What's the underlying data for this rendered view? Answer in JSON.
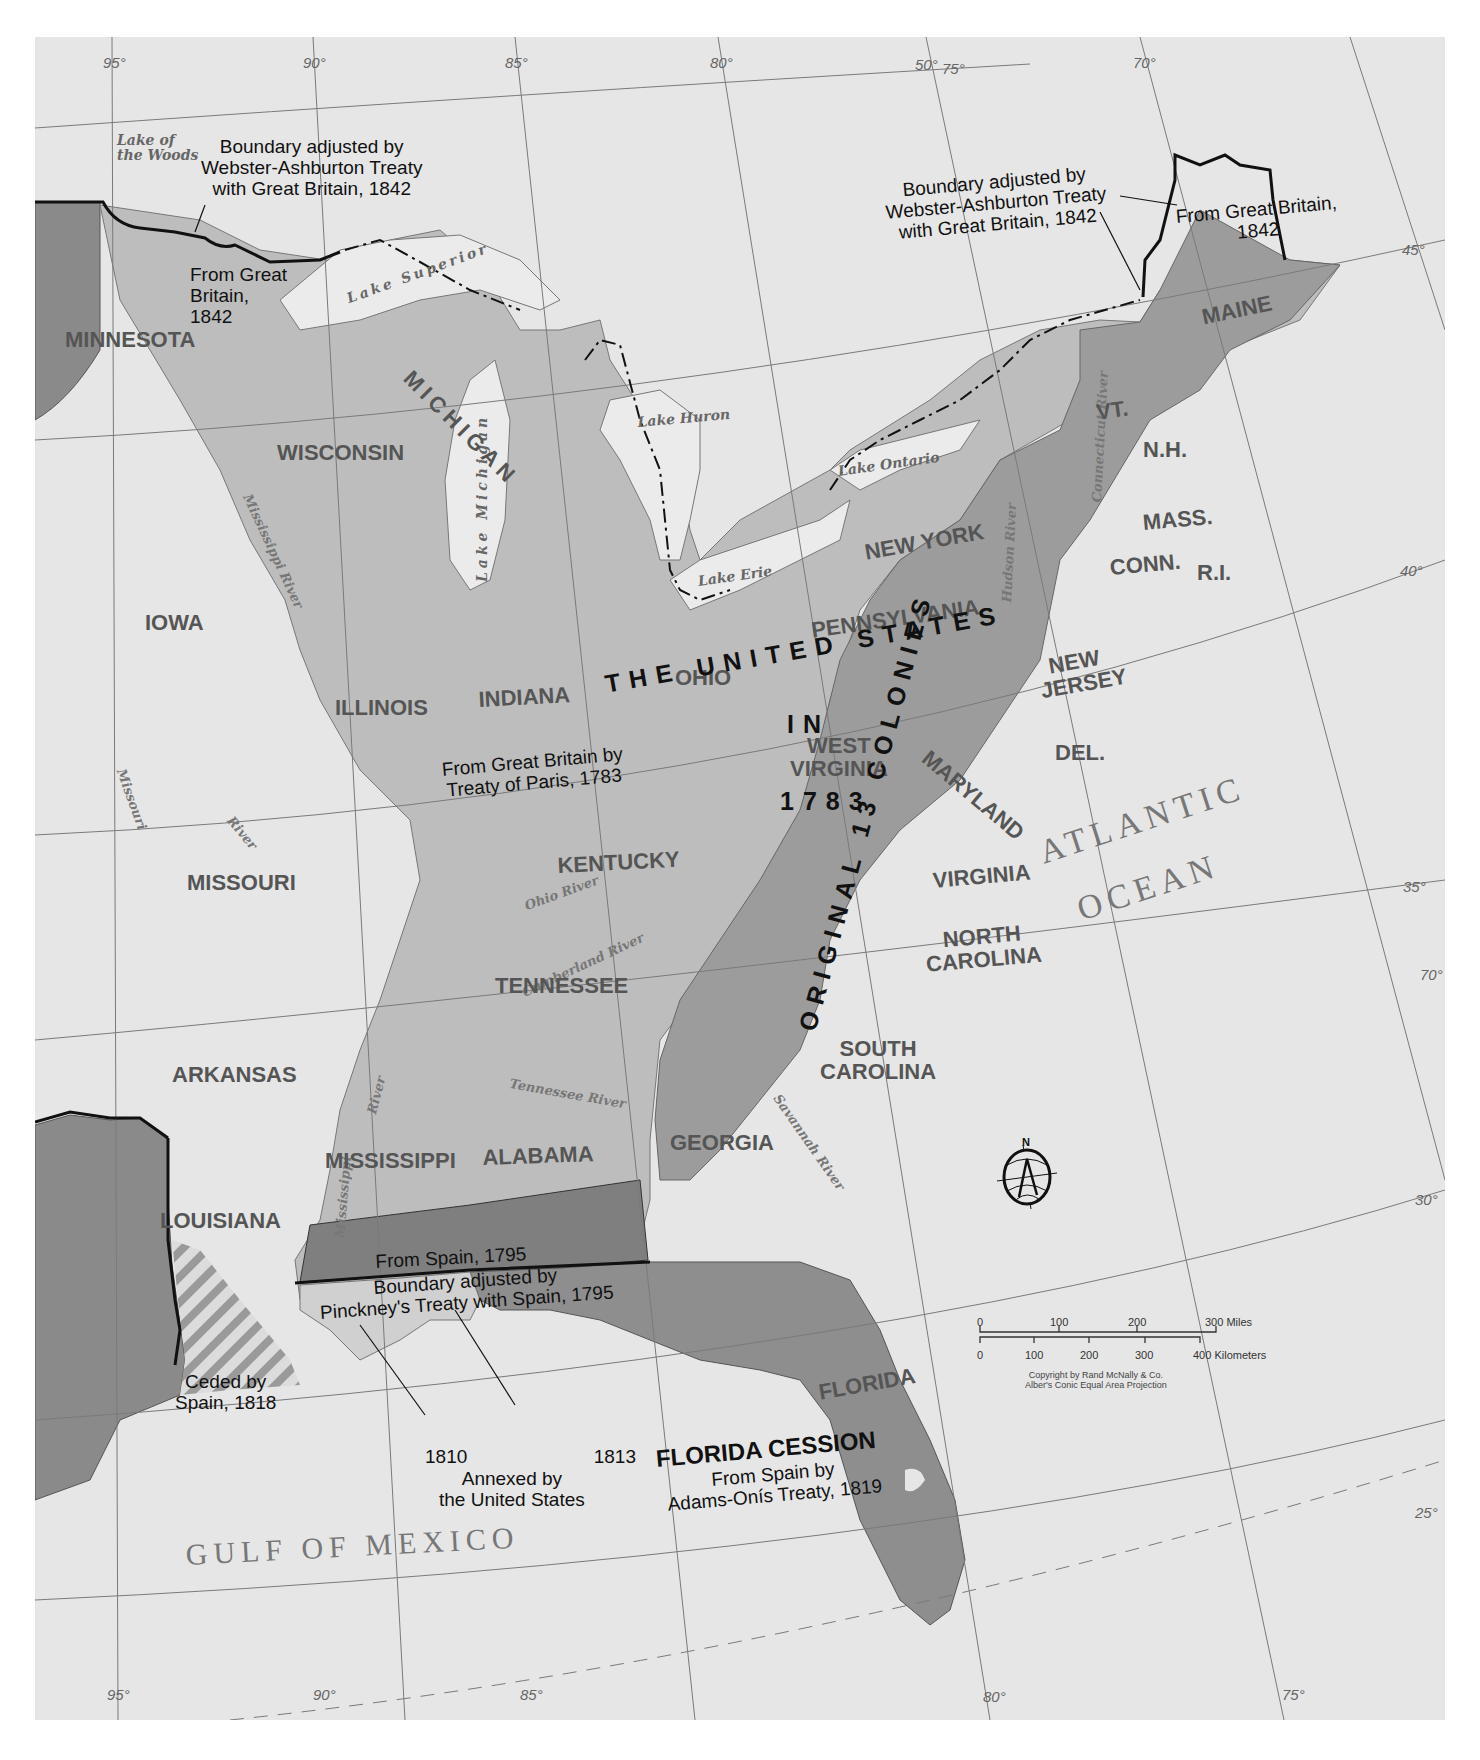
{
  "map": {
    "title": "The United States in 1783 and territorial additions to 1819",
    "colors": {
      "background": "#e6e6e6",
      "us_1783": "#bdbdbd",
      "original_13_colonies": "#9a9a9a",
      "spain_1795": "#7f7f7f",
      "florida_cession": "#8e8e8e",
      "annexed_1810_1813": "#cfcfcf",
      "foreign_west": "#8a8a8a",
      "water": "#e9e9e9",
      "boundary": "#111111"
    },
    "graticule": {
      "longitude_labels_top": [
        "95°",
        "90°",
        "85°",
        "80°",
        "75°",
        "70°"
      ],
      "longitude_labels_bottom": [
        "95°",
        "90°",
        "85°",
        "80°",
        "75°"
      ],
      "latitude_labels": [
        "50°",
        "45°",
        "40°",
        "35°",
        "30°",
        "25°"
      ],
      "extra_label": "70°"
    },
    "headline": {
      "line1": "THE UNITED STATES",
      "line2": "IN",
      "line3": "1783",
      "original": "ORIGINAL 13 COLONIES"
    },
    "states": {
      "minnesota": "MINNESOTA",
      "wisconsin": "WISCONSIN",
      "michigan": "MICHIGAN",
      "iowa": "IOWA",
      "illinois": "ILLINOIS",
      "indiana": "INDIANA",
      "ohio": "OHIO",
      "missouri": "MISSOURI",
      "kentucky": "KENTUCKY",
      "tennessee": "TENNESSEE",
      "arkansas": "ARKANSAS",
      "mississippi": "MISSISSIPPI",
      "alabama": "ALABAMA",
      "georgia": "GEORGIA",
      "louisiana": "LOUISIANA",
      "florida": "FLORIDA",
      "south_carolina_1": "SOUTH",
      "south_carolina_2": "CAROLINA",
      "north_carolina_1": "NORTH",
      "north_carolina_2": "CAROLINA",
      "virginia": "VIRGINIA",
      "west_virginia_1": "WEST",
      "west_virginia_2": "VIRGINIA",
      "maryland": "MARYLAND",
      "delaware": "DEL.",
      "new_jersey_1": "NEW",
      "new_jersey_2": "JERSEY",
      "pennsylvania": "PENNSYLVANIA",
      "new_york": "NEW YORK",
      "connecticut": "CONN.",
      "rhode_island": "R.I.",
      "massachusetts": "MASS.",
      "vermont": "VT.",
      "new_hampshire": "N.H.",
      "maine": "MAINE"
    },
    "water": {
      "lake_of_the_woods_1": "Lake of",
      "lake_of_the_woods_2": "the Woods",
      "lake_superior": "Lake Superior",
      "lake_michigan": "Lake Michigan",
      "lake_huron": "Lake Huron",
      "lake_erie": "Lake Erie",
      "lake_ontario": "Lake Ontario",
      "mississippi_river_north": "Mississippi River",
      "mississippi_river_south_1": "River",
      "mississippi_river_south_2": "Mississippi",
      "missouri_river_1": "Missouri",
      "missouri_river_2": "River",
      "ohio_river": "Ohio River",
      "cumberland_river": "Cumberland River",
      "tennessee_river": "Tennessee River",
      "savannah_river": "Savannah River",
      "hudson_river": "Hudson River",
      "connecticut_river": "Connecticut River",
      "atlantic_1": "ATLANTIC",
      "atlantic_2": "OCEAN",
      "gulf": "GULF OF MEXICO"
    },
    "annotations": {
      "webster_west": [
        "Boundary adjusted by",
        "Webster-Ashburton Treaty",
        "with Great Britain, 1842"
      ],
      "from_gb_1842_west": [
        "From Great",
        "Britain,",
        "1842"
      ],
      "webster_east": [
        "Boundary adjusted by",
        "Webster-Ashburton Treaty",
        "with Great Britain, 1842"
      ],
      "from_gb_1842_east": [
        "From Great Britain,",
        "1842"
      ],
      "treaty_of_paris": [
        "From Great Britain by",
        "Treaty of Paris, 1783"
      ],
      "spain_1795": "From Spain, 1795",
      "pinckney": [
        "Boundary adjusted by",
        "Pinckney's Treaty with Spain, 1795"
      ],
      "ceded_1818": [
        "Ceded by",
        "Spain, 1818"
      ],
      "annexed_years": [
        "1810",
        "1813"
      ],
      "annexed": [
        "Annexed by",
        "the United States"
      ],
      "florida_cession_title": "FLORIDA CESSION",
      "florida_cession_sub": [
        "From Spain by",
        "Adams-Onís Treaty, 1819"
      ]
    },
    "compass": {
      "label": "N",
      "icon": "compass-rose-icon"
    },
    "scale": {
      "miles_ticks": [
        "0",
        "100",
        "200",
        "300 Miles"
      ],
      "km_ticks": [
        "0",
        "100",
        "200",
        "300",
        "400 Kilometers"
      ]
    },
    "credits": [
      "Copyright by Rand McNally & Co.",
      "Alber's Conic Equal Area Projection"
    ]
  }
}
